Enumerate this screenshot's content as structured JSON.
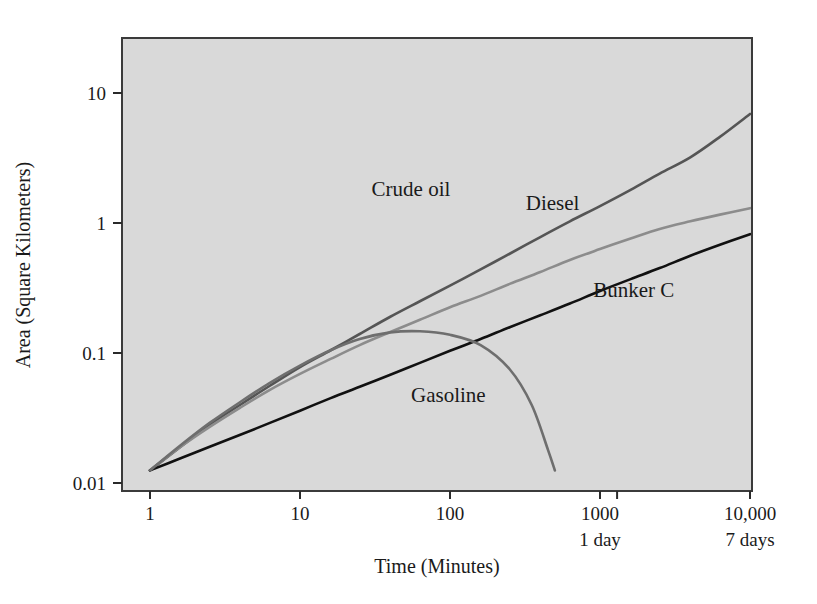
{
  "figure": {
    "background_color": "#ffffff",
    "plot_background_color": "#d9d9d9",
    "frame_color": "#3b3b3b"
  },
  "chart_data": {
    "type": "line",
    "title": "",
    "subtitle": "",
    "xlabel": "Time (Minutes)",
    "ylabel": "Area (Square Kilometers)",
    "xscale": "log",
    "yscale": "log",
    "xlim": [
      1,
      10000
    ],
    "ylim": [
      0.01,
      20
    ],
    "grid": false,
    "legend": "inline-annotations",
    "x_tick_labels": [
      "1",
      "10",
      "100",
      "1000",
      "10,000"
    ],
    "x_tick_values": [
      1,
      10,
      100,
      1000,
      10000
    ],
    "x_tick_sublabels": [
      "",
      "",
      "",
      "1 day",
      "7 days"
    ],
    "y_tick_labels": [
      "0.01",
      "0.1",
      "1",
      "10"
    ],
    "y_tick_values": [
      0.01,
      0.1,
      1,
      10
    ],
    "annotations": [
      {
        "text": "Crude oil",
        "x": 30,
        "y": 1.6,
        "color": "#555555"
      },
      {
        "text": "Diesel",
        "x": 320,
        "y": 1.25,
        "color": "#8c8c8c"
      },
      {
        "text": "Bunker C",
        "x": 900,
        "y": 0.27,
        "color": "#111111"
      },
      {
        "text": "Gasoline",
        "x": 55,
        "y": 0.042,
        "color": "#6e6e6e"
      }
    ],
    "series": [
      {
        "name": "Crude oil",
        "color": "#555555",
        "x": [
          1,
          1.6,
          2.5,
          4,
          6.3,
          10,
          16,
          25,
          40,
          63,
          100,
          160,
          250,
          400,
          630,
          1000,
          1600,
          2500,
          4000,
          6300,
          10000
        ],
        "y": [
          0.0125,
          0.019,
          0.028,
          0.04,
          0.056,
          0.078,
          0.105,
          0.14,
          0.19,
          0.25,
          0.33,
          0.44,
          0.58,
          0.78,
          1.03,
          1.35,
          1.8,
          2.4,
          3.2,
          4.6,
          6.9
        ]
      },
      {
        "name": "Diesel",
        "color": "#8c8c8c",
        "x": [
          1,
          1.6,
          2.5,
          4,
          6.3,
          10,
          16,
          25,
          40,
          63,
          100,
          160,
          250,
          400,
          630,
          1000,
          1600,
          2500,
          4000,
          6300,
          10000
        ],
        "y": [
          0.0125,
          0.019,
          0.027,
          0.038,
          0.052,
          0.069,
          0.09,
          0.115,
          0.145,
          0.18,
          0.225,
          0.275,
          0.34,
          0.42,
          0.52,
          0.63,
          0.76,
          0.9,
          1.03,
          1.16,
          1.3
        ]
      },
      {
        "name": "Bunker C",
        "color": "#111111",
        "x": [
          1,
          1.6,
          2.5,
          4,
          6.3,
          10,
          16,
          25,
          40,
          63,
          100,
          160,
          250,
          400,
          630,
          1000,
          1600,
          2500,
          4000,
          6300,
          10000
        ],
        "y": [
          0.0125,
          0.0155,
          0.019,
          0.0235,
          0.029,
          0.036,
          0.045,
          0.055,
          0.068,
          0.084,
          0.104,
          0.128,
          0.158,
          0.195,
          0.24,
          0.3,
          0.37,
          0.45,
          0.56,
          0.68,
          0.82
        ]
      },
      {
        "name": "Gasoline",
        "color": "#6e6e6e",
        "x": [
          1,
          1.6,
          2.5,
          4,
          6.3,
          10,
          16,
          25,
          40,
          63,
          100,
          160,
          250,
          350,
          450,
          500
        ],
        "y": [
          0.0125,
          0.0195,
          0.029,
          0.042,
          0.059,
          0.08,
          0.105,
          0.128,
          0.144,
          0.147,
          0.138,
          0.115,
          0.075,
          0.04,
          0.018,
          0.0125
        ]
      }
    ]
  }
}
